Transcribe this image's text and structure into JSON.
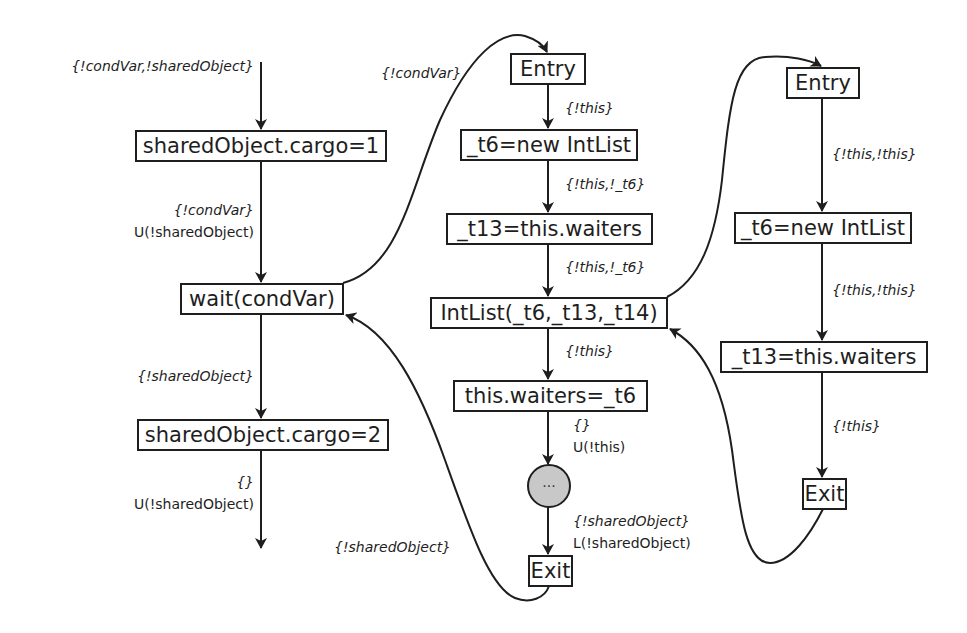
{
  "colors": {
    "stroke": "#1e1e1e",
    "circle_fill": "#c8c8c8",
    "background": "#ffffff"
  },
  "left_flow": {
    "incoming_label": "{!condVar,!sharedObject}",
    "node1": "sharedObject.cargo=1",
    "edge1_label": "{!condVar}",
    "edge1_action": "U(!sharedObject)",
    "node2": "wait(condVar)",
    "edge2_label": "{!sharedObject}",
    "node3": "sharedObject.cargo=2",
    "edge3_label": "{}",
    "edge3_action": "U(!sharedObject)"
  },
  "middle_flow": {
    "call_label": "{!condVar}",
    "entry": "Entry",
    "e1": "{!this}",
    "n1": "_t6=new IntList",
    "e2": "{!this,!_t6}",
    "n2": "_t13=this.waiters",
    "e3": "{!this,!_t6}",
    "n3": "IntList(_t6,_t13,_t14)",
    "e4": "{!this}",
    "n4": "this.waiters=_t6",
    "e5": "{}",
    "e5_action": "U(!this)",
    "ellipsis": "···",
    "e6": "{!sharedObject}",
    "e6_action": "L(!sharedObject)",
    "exit": "Exit",
    "return_label": "{!sharedObject}"
  },
  "right_flow": {
    "entry": "Entry",
    "e1": "{!this,!this}",
    "n1": "_t6=new IntList",
    "e2": "{!this,!this}",
    "n2": "_t13=this.waiters",
    "e3": "{!this}",
    "exit": "Exit"
  }
}
